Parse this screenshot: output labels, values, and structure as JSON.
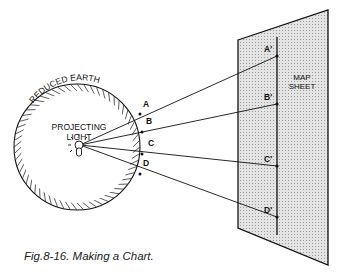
{
  "figure": {
    "caption": "Fig.8-16. Making a Chart.",
    "globe": {
      "label": "REDUCED EARTH",
      "light_label_line1": "PROJECTING",
      "light_label_line2": "LIGHT",
      "points": [
        "A",
        "B",
        "C",
        "D"
      ]
    },
    "sheet": {
      "label_line1": "MAP",
      "label_line2": "SHEET",
      "points": [
        "A'",
        "B'",
        "C'",
        "D'"
      ]
    },
    "colors": {
      "ink": "#111111",
      "sheet_fill": "#d9d9d9",
      "background": "#ffffff"
    }
  }
}
